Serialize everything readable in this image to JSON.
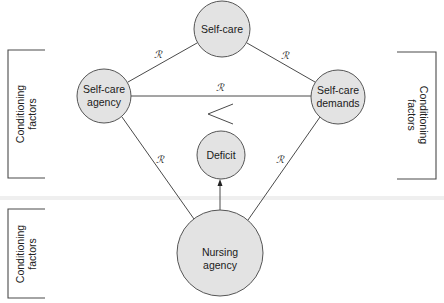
{
  "diagram": {
    "nodes": {
      "self_care": {
        "label": "Self-care",
        "cx": 222,
        "cy": 29,
        "r": 28
      },
      "self_care_agency": {
        "line1": "Self-care",
        "line2": "agency",
        "cx": 104,
        "cy": 96,
        "r": 27
      },
      "self_care_demands": {
        "line1": "Self-care",
        "line2": "demands",
        "cx": 338,
        "cy": 97,
        "r": 27
      },
      "deficit": {
        "label": "Deficit",
        "cx": 221,
        "cy": 155,
        "r": 24
      },
      "nursing_agency": {
        "line1": "Nursing",
        "line2": "agency",
        "cx": 220,
        "cy": 253,
        "r": 43
      }
    },
    "relations": {
      "symbol": "ℛ",
      "agency_selfcare": "ℛ",
      "selfcare_demands": "ℛ",
      "agency_demands": "ℛ",
      "agency_nursing": "ℛ",
      "demands_nursing": "ℛ"
    },
    "comparison_symbol": "<",
    "conditioning_factors": {
      "left_top": {
        "line1": "Conditioning",
        "line2": "factors"
      },
      "right": {
        "line1": "Conditioning",
        "line2": "factors"
      },
      "left_bottom": {
        "line1": "Conditioning",
        "line2": "factors"
      }
    },
    "colors": {
      "node_fill": "#e3e3e3",
      "stroke": "#4a4a4a",
      "text": "#1a1a1a"
    }
  }
}
